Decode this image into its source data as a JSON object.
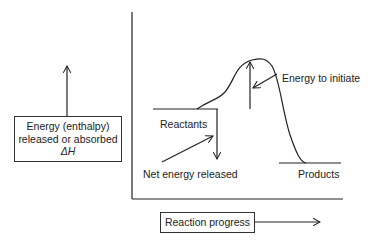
{
  "diagram": {
    "title": "",
    "y_axis_box": {
      "line1": "Energy (enthalpy)",
      "line2": "released or absorbed",
      "line3": "ΔH"
    },
    "x_axis_box": {
      "label": "Reaction progress"
    },
    "labels": {
      "reactants": "Reactants",
      "products": "Products",
      "energy_to_initiate": "Energy to initiate",
      "net_energy_released": "Net energy released"
    },
    "colors": {
      "line": "#222222",
      "background": "#ffffff"
    }
  }
}
